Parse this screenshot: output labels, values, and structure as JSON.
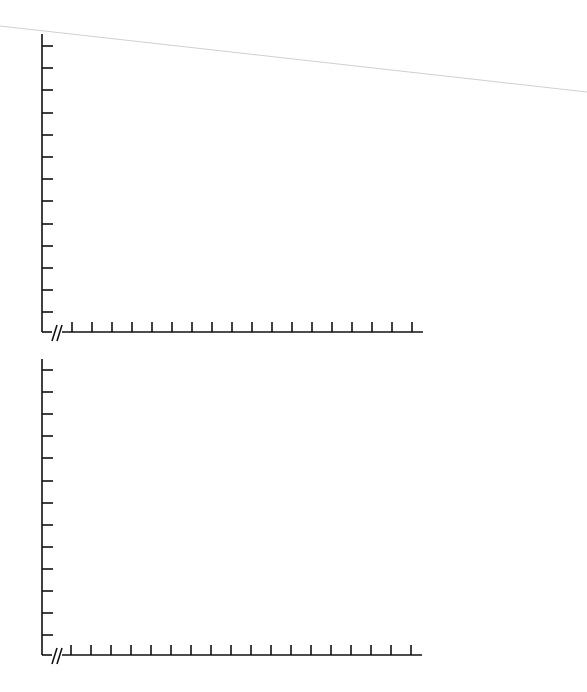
{
  "page": {
    "width": 587,
    "height": 692,
    "background": "#ffffff"
  },
  "decoration": {
    "diagonal_line": {
      "x1": 0,
      "y1": 26,
      "x2": 587,
      "y2": 92,
      "color": "#d0d0d0"
    }
  },
  "colors": {
    "axis": "#111111"
  },
  "chart_data": [
    {
      "type": "line",
      "title": "",
      "xlabel": "",
      "ylabel": "",
      "series": [],
      "x_tick_labels": [],
      "y_tick_labels": [],
      "x_tick_count": 18,
      "y_tick_count": 13,
      "axis_break": true,
      "grid": false,
      "layout": {
        "origin_x": 42,
        "axis_top": 34,
        "axis_bottom": 332,
        "axis_right": 423,
        "x_first_tick": 72,
        "x_tick_spacing": 20,
        "y_first_tick": 46,
        "y_tick_spacing": 22.2
      }
    },
    {
      "type": "line",
      "title": "",
      "xlabel": "",
      "ylabel": "",
      "series": [],
      "x_tick_labels": [],
      "y_tick_labels": [],
      "x_tick_count": 18,
      "y_tick_count": 13,
      "axis_break": true,
      "grid": false,
      "layout": {
        "origin_x": 42,
        "axis_top": 359,
        "axis_bottom": 655,
        "axis_right": 422,
        "x_first_tick": 71,
        "x_tick_spacing": 20,
        "y_first_tick": 370,
        "y_tick_spacing": 22.1
      }
    }
  ]
}
